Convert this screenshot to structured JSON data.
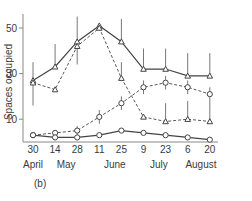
{
  "panel_label": "(b)",
  "chart_data": {
    "type": "line",
    "title": "",
    "xlabel": "",
    "ylabel": "Spaces occupied",
    "ylim": [
      0,
      55
    ],
    "y_ticks": [
      10,
      30,
      50
    ],
    "categories": [
      "30",
      "14",
      "28",
      "11",
      "25",
      "9",
      "23",
      "6",
      "20"
    ],
    "month_labels": [
      {
        "label": "April",
        "index": 0
      },
      {
        "label": "May",
        "index": 1.5
      },
      {
        "label": "June",
        "index": 3.7
      },
      {
        "label": "July",
        "index": 5.7
      },
      {
        "label": "August",
        "index": 7.6
      }
    ],
    "grid": false,
    "legend": null,
    "series": [
      {
        "name": "solid-triangle",
        "line": "solid",
        "marker": "triangle",
        "values": [
          27,
          33,
          44,
          51,
          44,
          32,
          32,
          29,
          29
        ],
        "error_up": [
          8,
          10,
          11,
          0,
          10,
          9,
          9,
          10,
          10
        ],
        "error_down": [
          11,
          0,
          0,
          0,
          0,
          0,
          0,
          0,
          0
        ]
      },
      {
        "name": "dashed-triangle",
        "line": "dashed",
        "marker": "triangle",
        "values": [
          26,
          23,
          42,
          50,
          28,
          11,
          9,
          10,
          9
        ],
        "error_up": [
          0,
          0,
          0,
          0,
          7,
          0,
          8,
          8,
          9
        ],
        "error_down": [
          0,
          0,
          8,
          0,
          0,
          0,
          0,
          0,
          0
        ]
      },
      {
        "name": "dashed-circle",
        "line": "dashed",
        "marker": "circle",
        "values": [
          3,
          4,
          5,
          11,
          17,
          24,
          26,
          24,
          21
        ],
        "error_up": [
          0,
          0,
          2,
          3,
          3,
          3,
          3,
          3,
          3
        ],
        "error_down": [
          0,
          0,
          2,
          3,
          3,
          3,
          3,
          3,
          3
        ]
      },
      {
        "name": "solid-circle",
        "line": "solid",
        "marker": "circle",
        "values": [
          3,
          2,
          2,
          3,
          5,
          4,
          3,
          2,
          1
        ],
        "error_up": [
          0,
          0,
          0,
          0,
          0,
          0,
          0,
          0,
          0
        ],
        "error_down": [
          0,
          0,
          0,
          0,
          0,
          0,
          0,
          0,
          0
        ]
      }
    ]
  }
}
